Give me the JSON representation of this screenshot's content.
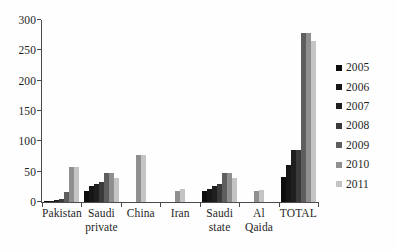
{
  "chart_data": {
    "type": "bar",
    "title": "",
    "subtitle": "",
    "xlabel": "",
    "ylabel": "",
    "ylim": [
      0,
      300
    ],
    "yticks": [
      0,
      50,
      100,
      150,
      200,
      250,
      300
    ],
    "grid": false,
    "legend_position": "right",
    "categories": [
      "Pakistan",
      "Saudi private",
      "China",
      "Iran",
      "Saudi state",
      "Al Qaida",
      "TOTAL"
    ],
    "category_lines": [
      [
        "Pakistan",
        ""
      ],
      [
        "Saudi",
        "private"
      ],
      [
        "China",
        ""
      ],
      [
        "Iran",
        ""
      ],
      [
        "Saudi",
        "state"
      ],
      [
        "Al Qaida",
        ""
      ],
      [
        "TOTAL",
        ""
      ]
    ],
    "series": [
      {
        "name": "2005",
        "color": "#0d0d0d",
        "values": [
          1,
          18,
          0,
          0,
          18,
          0,
          42
        ]
      },
      {
        "name": "2006",
        "color": "#161616",
        "values": [
          2,
          27,
          0,
          0,
          22,
          0,
          61
        ]
      },
      {
        "name": "2007",
        "color": "#1f1f1f",
        "values": [
          3,
          30,
          0,
          0,
          26,
          0,
          85
        ]
      },
      {
        "name": "2008",
        "color": "#3a3a3a",
        "values": [
          5,
          33,
          0,
          0,
          30,
          0,
          85
        ]
      },
      {
        "name": "2009",
        "color": "#5e5e5e",
        "values": [
          16,
          48,
          0,
          0,
          48,
          0,
          278
        ]
      },
      {
        "name": "2010",
        "color": "#8f8f8f",
        "values": [
          58,
          48,
          78,
          18,
          48,
          18,
          278
        ]
      },
      {
        "name": "2011",
        "color": "#c4c4c4",
        "values": [
          58,
          39,
          78,
          21,
          39,
          19,
          265
        ]
      }
    ]
  },
  "axis": {
    "y_tick_labels": [
      "300",
      "250",
      "200",
      "150",
      "100",
      "50",
      "0"
    ]
  },
  "legend": {
    "entries": [
      "2005",
      "2006",
      "2007",
      "2008",
      "2009",
      "2010",
      "2011"
    ]
  }
}
